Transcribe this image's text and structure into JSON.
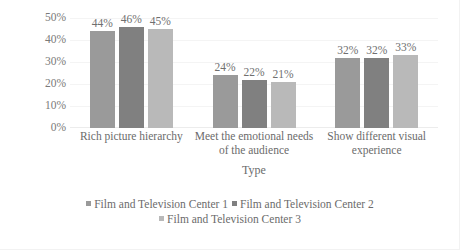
{
  "chart_data": {
    "type": "bar",
    "title": "",
    "xlabel": "Type",
    "ylabel": "Percentage",
    "ylim": [
      0,
      50
    ],
    "ytick_labels": [
      "50%",
      "40%",
      "30%",
      "20%",
      "10%",
      "0%"
    ],
    "ytick_values": [
      50,
      40,
      30,
      20,
      10,
      0
    ],
    "grid": true,
    "legend_position": "bottom",
    "categories": [
      "Rich picture hierarchy",
      "Meet the emotional needs of the audience",
      "Show different visual experience"
    ],
    "category_lines": [
      [
        "Rich picture hierarchy"
      ],
      [
        "Meet the emotional needs",
        "of the audience"
      ],
      [
        "Show different visual",
        "experience"
      ]
    ],
    "series": [
      {
        "name": "Film and Television Center 1",
        "color": "#9a9a9a",
        "values": [
          44,
          24,
          32
        ],
        "labels": [
          "44%",
          "24%",
          "32%"
        ]
      },
      {
        "name": "Film and Television Center 2",
        "color": "#808080",
        "values": [
          46,
          22,
          32
        ],
        "labels": [
          "46%",
          "22%",
          "32%"
        ]
      },
      {
        "name": "Film and Television Center 3",
        "color": "#b9b9b9",
        "values": [
          45,
          21,
          33
        ],
        "labels": [
          "45%",
          "21%",
          "33%"
        ]
      }
    ]
  }
}
